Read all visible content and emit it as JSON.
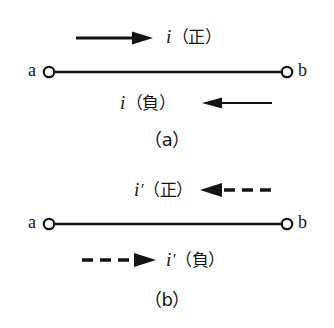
{
  "figure": {
    "type": "line-diagram",
    "background_color": "#ffffff",
    "ink_color": "#141414",
    "panels": [
      {
        "id": "a",
        "caption": "（a）",
        "terminals": {
          "left": "a",
          "right": "b"
        },
        "arrows": [
          {
            "id": "a-top",
            "label_symbol": "i",
            "label_prime": "",
            "label_paren": "（正）",
            "label_full": "i（正）",
            "direction": "right",
            "style": "solid",
            "position": "above-wire"
          },
          {
            "id": "a-bottom",
            "label_symbol": "i",
            "label_prime": "",
            "label_paren": "（負）",
            "label_full": "i（負）",
            "direction": "left",
            "style": "solid",
            "position": "below-wire"
          }
        ]
      },
      {
        "id": "b",
        "caption": "（b）",
        "terminals": {
          "left": "a",
          "right": "b"
        },
        "arrows": [
          {
            "id": "b-top",
            "label_symbol": "i",
            "label_prime": "′",
            "label_paren": "（正）",
            "label_full": "i′（正）",
            "direction": "left",
            "style": "dashed",
            "position": "above-wire"
          },
          {
            "id": "b-bottom",
            "label_symbol": "i",
            "label_prime": "′",
            "label_paren": "（負）",
            "label_full": "i′（負）",
            "direction": "right",
            "style": "dashed",
            "position": "below-wire"
          }
        ]
      }
    ]
  }
}
